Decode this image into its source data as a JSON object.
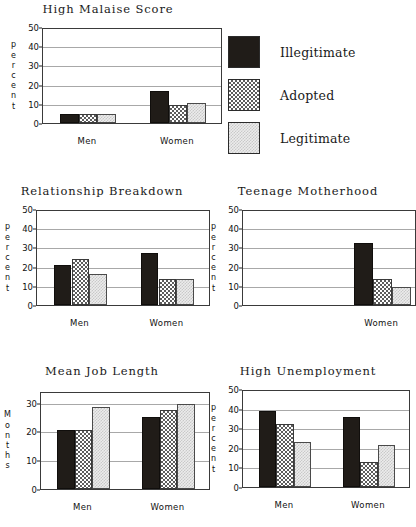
{
  "legend": {
    "position": "top-right",
    "entries": [
      {
        "label": "Illegitimate",
        "pattern": "solid",
        "color": "#201c18"
      },
      {
        "label": "Adopted",
        "pattern": "check",
        "color": "#5d5d5d"
      },
      {
        "label": "Legitimate",
        "pattern": "dots",
        "color": "#ececec"
      }
    ]
  },
  "charts": [
    {
      "id": "high-malaise-score",
      "title": "High Malaise Score",
      "ylabel": "percent",
      "ylabel_letters": [
        "p",
        "e",
        "r",
        "c",
        "e",
        "n",
        "t"
      ],
      "ticks": [
        "0",
        "10",
        "20",
        "30",
        "40",
        "50"
      ],
      "categories": [
        "Men",
        "Women"
      ]
    },
    {
      "id": "relationship-breakdown",
      "title": "Relationship Breakdown",
      "ylabel": "percent",
      "ylabel_letters": [
        "p",
        "e",
        "r",
        "c",
        "e",
        "n",
        "t"
      ],
      "ticks": [
        "0",
        "10",
        "20",
        "30",
        "40",
        "50"
      ],
      "categories": [
        "Men",
        "Women"
      ]
    },
    {
      "id": "teenage-motherhood",
      "title": "Teenage Motherhood",
      "ylabel": "percent",
      "ylabel_letters": [
        "p",
        "e",
        "r",
        "c",
        "e",
        "n",
        "t"
      ],
      "ticks": [
        "0",
        "10",
        "20",
        "30",
        "40",
        "50"
      ],
      "categories": [
        "Women"
      ]
    },
    {
      "id": "mean-job-length",
      "title": "Mean Job Length",
      "ylabel": "Months",
      "ylabel_letters": [
        "M",
        "o",
        "n",
        "t",
        "h",
        "s"
      ],
      "ticks": [
        "0",
        "10",
        "20",
        "30"
      ],
      "categories": [
        "Men",
        "Women"
      ]
    },
    {
      "id": "high-unemployment",
      "title": "High Unemployment",
      "ylabel": "percent",
      "ylabel_letters": [
        "p",
        "e",
        "r",
        "c",
        "e",
        "n",
        "t"
      ],
      "ticks": [
        "0",
        "10",
        "20",
        "30",
        "40",
        "50"
      ],
      "categories": [
        "Men",
        "Women"
      ]
    }
  ],
  "chart_data": [
    {
      "type": "bar",
      "title": "High Malaise Score",
      "xlabel": "",
      "ylabel": "percent",
      "ylim": [
        0,
        50
      ],
      "yticks": [
        0,
        10,
        20,
        30,
        40,
        50
      ],
      "grid": true,
      "legend": "shared-top-right",
      "categories": [
        "Men",
        "Women"
      ],
      "series": [
        {
          "name": "Illegitimate",
          "values": [
            4.7,
            16.5
          ]
        },
        {
          "name": "Adopted",
          "values": [
            4.7,
            9.5
          ]
        },
        {
          "name": "Legitimate",
          "values": [
            4.8,
            10.2
          ]
        }
      ]
    },
    {
      "type": "bar",
      "title": "Relationship Breakdown",
      "xlabel": "",
      "ylabel": "percent",
      "ylim": [
        0,
        50
      ],
      "yticks": [
        0,
        10,
        20,
        30,
        40,
        50
      ],
      "grid": true,
      "legend": "shared-top-right",
      "categories": [
        "Men",
        "Women"
      ],
      "series": [
        {
          "name": "Illegitimate",
          "values": [
            21,
            27
          ]
        },
        {
          "name": "Adopted",
          "values": [
            24,
            13.5
          ]
        },
        {
          "name": "Legitimate",
          "values": [
            16,
            13.5
          ]
        }
      ]
    },
    {
      "type": "bar",
      "title": "Teenage Motherhood",
      "xlabel": "",
      "ylabel": "percent",
      "ylim": [
        0,
        50
      ],
      "yticks": [
        0,
        10,
        20,
        30,
        40,
        50
      ],
      "grid": true,
      "legend": "shared-top-right",
      "categories": [
        "Women"
      ],
      "series": [
        {
          "name": "Illegitimate",
          "values": [
            32.5
          ]
        },
        {
          "name": "Adopted",
          "values": [
            13.5
          ]
        },
        {
          "name": "Legitimate",
          "values": [
            9.5
          ]
        }
      ]
    },
    {
      "type": "bar",
      "title": "Mean Job Length",
      "xlabel": "",
      "ylabel": "Months",
      "ylim": [
        0,
        34
      ],
      "yticks": [
        0,
        10,
        20,
        30
      ],
      "grid": true,
      "legend": "shared-top-right",
      "categories": [
        "Men",
        "Women"
      ],
      "series": [
        {
          "name": "Illegitimate",
          "values": [
            20.5,
            25
          ]
        },
        {
          "name": "Adopted",
          "values": [
            20.5,
            27.5
          ]
        },
        {
          "name": "Legitimate",
          "values": [
            28.5,
            29.5
          ]
        }
      ]
    },
    {
      "type": "bar",
      "title": "High Unemployment",
      "xlabel": "",
      "ylabel": "percent",
      "ylim": [
        0,
        50
      ],
      "yticks": [
        0,
        10,
        20,
        30,
        40,
        50
      ],
      "grid": true,
      "legend": "shared-top-right",
      "categories": [
        "Men",
        "Women"
      ],
      "series": [
        {
          "name": "Illegitimate",
          "values": [
            39,
            35.5
          ]
        },
        {
          "name": "Adopted",
          "values": [
            32,
            13
          ]
        },
        {
          "name": "Legitimate",
          "values": [
            23,
            21.5
          ]
        }
      ]
    }
  ]
}
